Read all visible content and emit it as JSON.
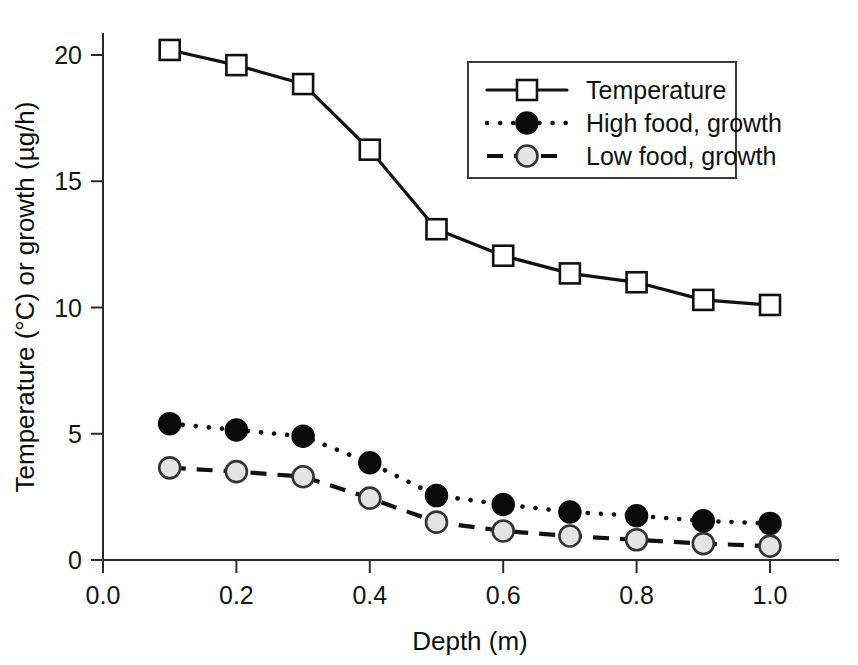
{
  "chart_data": {
    "type": "line",
    "title": "",
    "xlabel": "Depth (m)",
    "ylabel": "Temperature (°C) or growth (µg/h)",
    "xlim": [
      0.0,
      1.1
    ],
    "ylim": [
      0,
      21
    ],
    "grid": false,
    "legend_position": "top-right",
    "x": [
      0.1,
      0.2,
      0.3,
      0.4,
      0.5,
      0.6,
      0.7,
      0.8,
      0.9,
      1.0
    ],
    "xticks": [
      "0.0",
      "0.2",
      "0.4",
      "0.6",
      "0.8",
      "1.0"
    ],
    "xtick_values": [
      0.0,
      0.2,
      0.4,
      0.6,
      0.8,
      1.0
    ],
    "yticks": [
      "0",
      "5",
      "10",
      "15",
      "20"
    ],
    "ytick_values": [
      0,
      5,
      10,
      15,
      20
    ],
    "series": [
      {
        "name": "Temperature",
        "marker": "open-square",
        "linestyle": "solid",
        "color": "#111111",
        "values": [
          20.2,
          19.6,
          18.85,
          16.25,
          13.1,
          12.05,
          11.35,
          11.0,
          10.3,
          10.1
        ]
      },
      {
        "name": "High food, growth",
        "marker": "filled-circle",
        "linestyle": "dotted",
        "color": "#0a0a0a",
        "values": [
          5.4,
          5.15,
          4.9,
          3.85,
          2.55,
          2.2,
          1.9,
          1.75,
          1.55,
          1.45
        ]
      },
      {
        "name": "Low food, growth",
        "marker": "gray-circle",
        "linestyle": "dashed",
        "color": "#e4e4e4",
        "values": [
          3.65,
          3.5,
          3.3,
          2.45,
          1.5,
          1.15,
          0.95,
          0.8,
          0.65,
          0.55
        ]
      }
    ]
  },
  "legend": {
    "entries": [
      {
        "label": "Temperature"
      },
      {
        "label": "High food, growth"
      },
      {
        "label": "Low food, growth"
      }
    ]
  },
  "axes": {
    "x_title": "Depth (m)",
    "y_title": "Temperature (°C) or growth (µg/h)"
  }
}
